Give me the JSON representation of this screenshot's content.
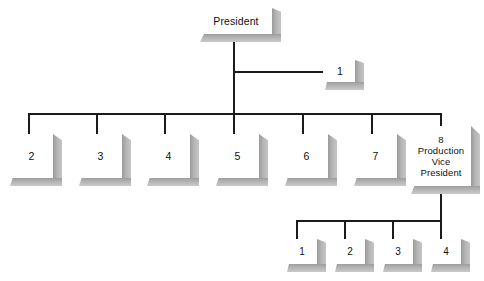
{
  "diagram": {
    "title_node": {
      "label": "President"
    },
    "staff_node": {
      "label": "1"
    },
    "main_row": [
      {
        "label": "2"
      },
      {
        "label": "3"
      },
      {
        "label": "4"
      },
      {
        "label": "5"
      },
      {
        "label": "6"
      },
      {
        "label": "7"
      },
      {
        "label": "8\nProduction\nVice\nPresident"
      }
    ],
    "bottom_row": [
      {
        "label": "1"
      },
      {
        "label": "2"
      },
      {
        "label": "3"
      },
      {
        "label": "4"
      }
    ],
    "colors": {
      "line": "#1b1b1b",
      "box_face": "#ffffff",
      "box_shadow": "#b4b4b4",
      "text": "#101010",
      "background": "#ffffff"
    }
  }
}
